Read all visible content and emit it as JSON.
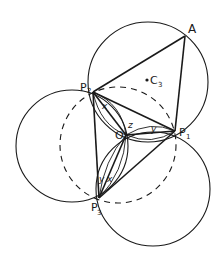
{
  "diagram": {
    "labels": {
      "A": "A",
      "P1": "P",
      "P1_sub": "1",
      "P2": "P",
      "P2_sub": "2",
      "P3": "P",
      "P3_sub": "3",
      "O": "O",
      "C3": "C",
      "C3_sub": "3",
      "x_top": "x",
      "x_bottom": "x",
      "y_right": "y",
      "y_bottom": "y",
      "z": "z"
    },
    "colors": {
      "stroke": "#1a1a1a",
      "background": "#ffffff"
    }
  }
}
